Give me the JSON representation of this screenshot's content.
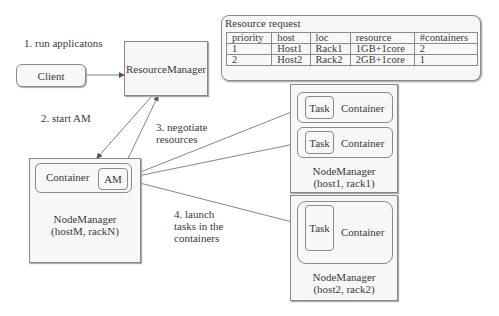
{
  "steps": {
    "run": "1. run applicatons",
    "start_am": "2. start AM",
    "negotiate_1": "3. negotiate",
    "negotiate_2": "resources",
    "launch_1": "4. launch",
    "launch_2": "tasks in the",
    "launch_3": "containers"
  },
  "client": {
    "label": "Client"
  },
  "resource_manager": {
    "label": "ResourceManager"
  },
  "resource_request": {
    "title": "Resource request",
    "columns": [
      "priority",
      "host",
      "loc",
      "resource",
      "#containers"
    ],
    "rows": [
      [
        "1",
        "Host1",
        "Rack1",
        "1GB+1core",
        "2"
      ],
      [
        "2",
        "Host2",
        "Rack2",
        "2GB+1core",
        "1"
      ]
    ]
  },
  "node_manager_m": {
    "name": "NodeManager",
    "location": "(hostM, rackN)",
    "container_label": "Container",
    "am_label": "AM"
  },
  "node_manager_1": {
    "name": "NodeManager",
    "location": "(host1, rack1)",
    "containers": [
      {
        "task": "Task",
        "label": "Container"
      },
      {
        "task": "Task",
        "label": "Container"
      }
    ]
  },
  "node_manager_2": {
    "name": "NodeManager",
    "location": "(host2, rack2)",
    "containers": [
      {
        "task": "Task",
        "label": "Container"
      }
    ]
  }
}
